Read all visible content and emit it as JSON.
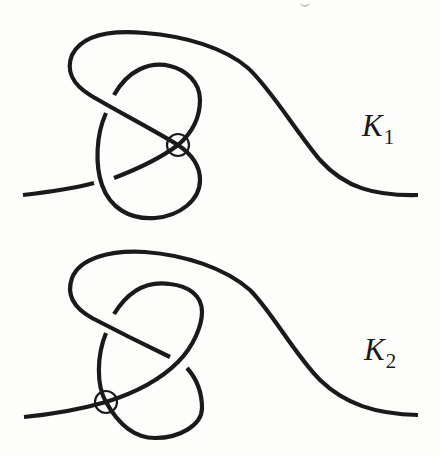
{
  "figure": {
    "stroke_color": "#1a1a1a",
    "background_color": "#fdfdfb",
    "knots": [
      {
        "id": "K1",
        "label_main": "K",
        "label_sub": "1",
        "circled_crossing": {
          "cx": 178,
          "cy": 145,
          "r": 11
        }
      },
      {
        "id": "K2",
        "label_main": "K",
        "label_sub": "2",
        "circled_crossing": {
          "cx": 106,
          "cy": 402,
          "r": 11
        }
      }
    ]
  }
}
